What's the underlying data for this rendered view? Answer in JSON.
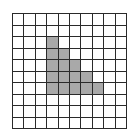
{
  "grid": {
    "rows": 10,
    "cols": 10,
    "line_color": "#2a2a2a",
    "fill_color": "#ffffff",
    "shade_color": "#a9a9a9",
    "shaded_cells": [
      [
        2,
        3
      ],
      [
        3,
        3
      ],
      [
        3,
        4
      ],
      [
        4,
        3
      ],
      [
        4,
        4
      ],
      [
        4,
        5
      ],
      [
        5,
        3
      ],
      [
        5,
        4
      ],
      [
        5,
        5
      ],
      [
        5,
        6
      ],
      [
        6,
        3
      ],
      [
        6,
        4
      ],
      [
        6,
        5
      ],
      [
        6,
        6
      ],
      [
        6,
        7
      ]
    ]
  }
}
